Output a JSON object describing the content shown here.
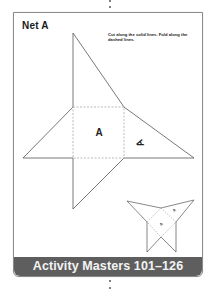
{
  "page": {
    "title": "Net A",
    "instructions": "Cut along the solid lines. Fold along the dashed lines.",
    "face_label": "A",
    "banner": "Activity Masters 101–126"
  },
  "colors": {
    "frame_border": "#8a8a8a",
    "banner_bg": "#5e5e5e",
    "banner_text": "#f4f4f4",
    "line": "#555555",
    "dashed_line": "#aaaaaa"
  }
}
